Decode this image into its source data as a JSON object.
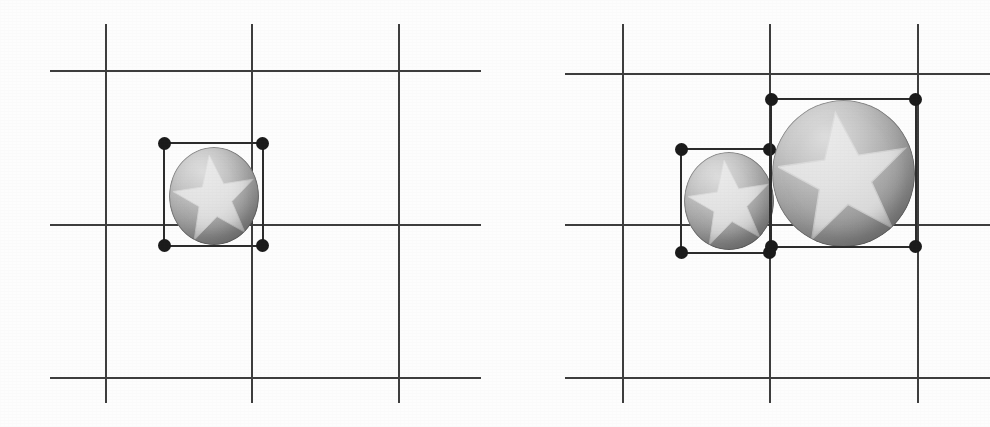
{
  "canvas": {
    "width": 990,
    "height": 427,
    "background_color": "#fdfdfd",
    "grid_color": "#3d3d3d",
    "handle_color": "#1a1a1a",
    "selection_border_color": "#2b2b2b",
    "sphere_base_color": "#a6a6a6",
    "star_color": "#e2e2e2"
  },
  "panels": [
    {
      "id": "viewport-left",
      "label": "Left viewport",
      "x": 0,
      "width": 495,
      "grid": {
        "vertical_lines": [
          {
            "x": 105,
            "y1": 24,
            "y2": 403
          },
          {
            "x": 251,
            "y1": 24,
            "y2": 403
          },
          {
            "x": 398,
            "y1": 24,
            "y2": 403
          }
        ],
        "horizontal_lines": [
          {
            "y": 70,
            "x1": 50,
            "x2": 481
          },
          {
            "y": 224,
            "x1": 50,
            "x2": 481
          },
          {
            "y": 377,
            "x1": 50,
            "x2": 481
          }
        ]
      },
      "objects": [
        {
          "id": "sphere-small-left",
          "name": "Star sphere",
          "shape": "sphere",
          "texture": "star",
          "x": 169,
          "y": 147,
          "width": 90,
          "height": 98,
          "selected": true,
          "selection_box": {
            "x": 163,
            "y": 142,
            "width": 101,
            "height": 105
          },
          "handles": [
            "top-left",
            "top-right",
            "bottom-left",
            "bottom-right"
          ]
        }
      ]
    },
    {
      "id": "viewport-right",
      "label": "Right viewport",
      "x": 495,
      "width": 495,
      "grid": {
        "vertical_lines": [
          {
            "x": 622,
            "y1": 24,
            "y2": 403
          },
          {
            "x": 769,
            "y1": 24,
            "y2": 403
          },
          {
            "x": 917,
            "y1": 24,
            "y2": 403
          }
        ],
        "horizontal_lines": [
          {
            "y": 73,
            "x1": 565,
            "x2": 990
          },
          {
            "y": 224,
            "x1": 565,
            "x2": 990
          },
          {
            "y": 377,
            "x1": 565,
            "x2": 990
          }
        ]
      },
      "objects": [
        {
          "id": "sphere-small-right",
          "name": "Star sphere (small)",
          "shape": "sphere",
          "texture": "star",
          "x": 684,
          "y": 152,
          "width": 90,
          "height": 98,
          "selected": true,
          "selection_box": {
            "x": 680,
            "y": 148,
            "width": 91,
            "height": 106
          },
          "handles": [
            "top-left",
            "top-right",
            "bottom-left",
            "bottom-right"
          ]
        },
        {
          "id": "sphere-large-right",
          "name": "Star sphere (large)",
          "shape": "sphere",
          "texture": "star",
          "x": 772,
          "y": 100,
          "width": 143,
          "height": 147,
          "selected": true,
          "selection_box": {
            "x": 770,
            "y": 98,
            "width": 147,
            "height": 150
          },
          "handles": [
            "top-left",
            "top-right",
            "bottom-left",
            "bottom-right"
          ]
        }
      ]
    }
  ]
}
